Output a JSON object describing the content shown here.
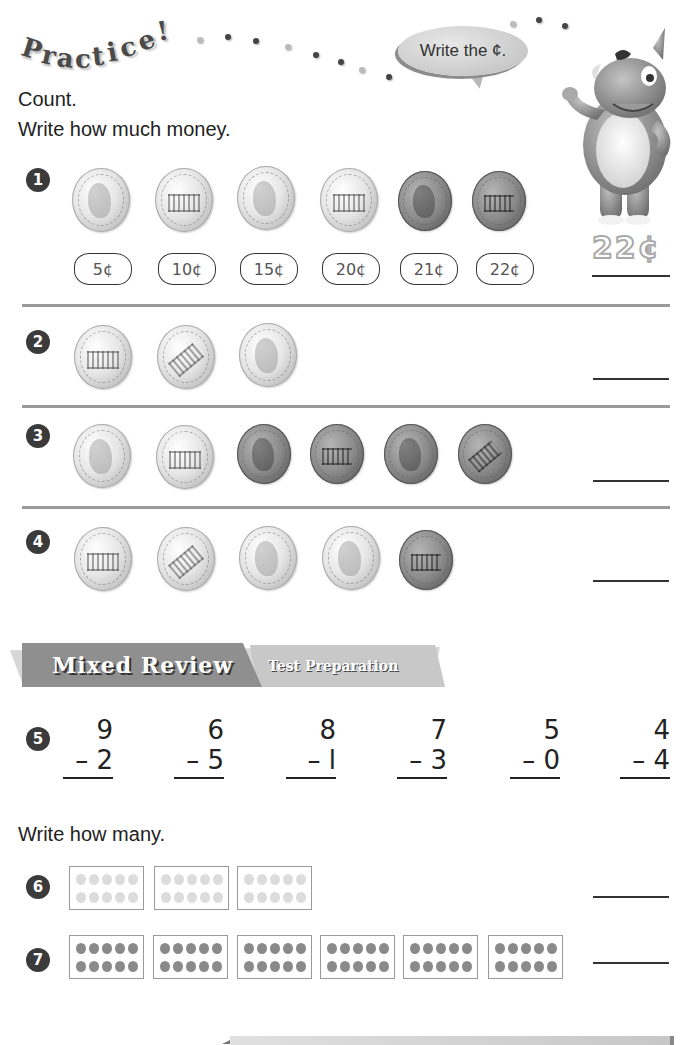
{
  "header": {
    "title_letters": [
      "P",
      "r",
      "a",
      "c",
      "t",
      "i",
      "c",
      "e",
      "!"
    ],
    "speech_bubble": "Write the ¢.",
    "mascot": "rhino-mascot"
  },
  "instructions": {
    "line1": "Count.",
    "line2": "Write how much money."
  },
  "money_exercises": [
    {
      "number": "1",
      "coins": [
        "nickel-heads",
        "nickel-tails",
        "nickel-heads",
        "nickel-tails",
        "penny-heads",
        "penny-tails"
      ],
      "counts": [
        "5¢",
        "10¢",
        "15¢",
        "20¢",
        "21¢",
        "22¢"
      ],
      "answer": "22¢"
    },
    {
      "number": "2",
      "coins": [
        "nickel-tails",
        "nickel-tails",
        "nickel-heads"
      ],
      "answer": ""
    },
    {
      "number": "3",
      "coins": [
        "nickel-heads",
        "nickel-tails",
        "penny-heads",
        "penny-tails",
        "penny-heads",
        "penny-tails"
      ],
      "answer": ""
    },
    {
      "number": "4",
      "coins": [
        "nickel-tails",
        "nickel-tails",
        "nickel-heads",
        "nickel-heads",
        "penny-tails"
      ],
      "answer": ""
    }
  ],
  "banner": {
    "main": "Mixed Review",
    "sub": "Test Preparation"
  },
  "subtraction": {
    "number": "5",
    "problems": [
      {
        "top": "9",
        "bottom": "– 2"
      },
      {
        "top": "6",
        "bottom": "– 5"
      },
      {
        "top": "8",
        "bottom": "– l"
      },
      {
        "top": "7",
        "bottom": "– 3"
      },
      {
        "top": "5",
        "bottom": "– 0"
      },
      {
        "top": "4",
        "bottom": "– 4"
      }
    ]
  },
  "how_many": {
    "instruction": "Write how many.",
    "items": [
      {
        "number": "6",
        "frames": 3,
        "dots_per_frame": 10,
        "answer": ""
      },
      {
        "number": "7",
        "frames": 6,
        "dots_per_frame": 10,
        "answer": ""
      }
    ]
  }
}
